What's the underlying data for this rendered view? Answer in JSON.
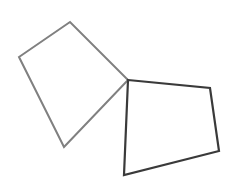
{
  "canvas": {
    "width": 243,
    "height": 183,
    "background": "#ffffff"
  },
  "shapes": [
    {
      "name": "gray-quadrilateral",
      "points": "70,22 19,57 64,147 128,80",
      "stroke": "#808080",
      "stroke_width": 2
    },
    {
      "name": "dark-quadrilateral",
      "points": "128,80 210,88 219,151 124,175",
      "stroke": "#3a3a3a",
      "stroke_width": 2.2
    }
  ]
}
